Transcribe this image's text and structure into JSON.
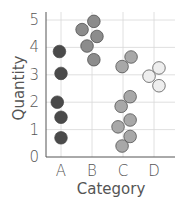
{
  "chart_data": {
    "type": "scatter",
    "title": "",
    "xlabel": "Category",
    "ylabel": "Quantity",
    "categories": [
      "A",
      "B",
      "C",
      "D"
    ],
    "yticks": [
      "0",
      "1",
      "2",
      "3",
      "4",
      "5"
    ],
    "ylim": [
      0,
      5.2
    ],
    "grid": true,
    "legend": "none",
    "series": [
      {
        "name": "A",
        "color": "#4a4a4a",
        "points": [
          [
            -0.05,
            3.85
          ],
          [
            0.0,
            3.05
          ],
          [
            -0.12,
            2.0
          ],
          [
            0.0,
            1.45
          ],
          [
            0.0,
            0.7
          ]
        ]
      },
      {
        "name": "B",
        "color": "#8c8c8c",
        "points": [
          [
            0.06,
            4.95
          ],
          [
            -0.32,
            4.65
          ],
          [
            0.16,
            4.4
          ],
          [
            -0.16,
            4.05
          ],
          [
            0.06,
            3.55
          ]
        ]
      },
      {
        "name": "C",
        "color": "#a8a8a8",
        "points": [
          [
            -0.03,
            3.3
          ],
          [
            0.26,
            3.65
          ],
          [
            0.23,
            2.2
          ],
          [
            -0.06,
            1.85
          ],
          [
            0.23,
            1.35
          ],
          [
            -0.16,
            1.1
          ],
          [
            0.23,
            0.75
          ],
          [
            -0.03,
            0.4
          ]
        ]
      },
      {
        "name": "D",
        "color": "#eeeeee",
        "points": [
          [
            -0.16,
            2.95
          ],
          [
            0.16,
            3.25
          ],
          [
            0.16,
            2.6
          ]
        ]
      }
    ]
  }
}
